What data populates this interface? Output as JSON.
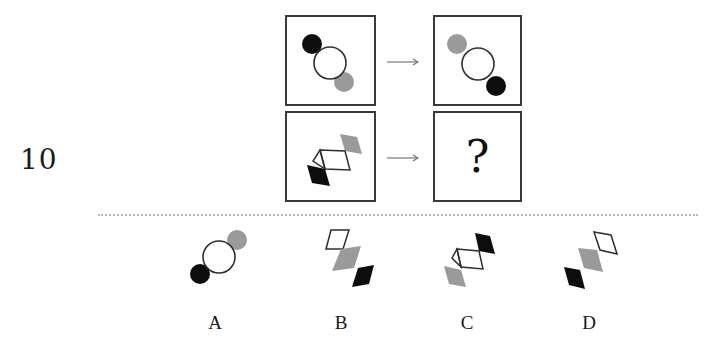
{
  "question": {
    "number": "10",
    "missing_symbol": "?",
    "arrow_symbol": "→",
    "rows": [
      {
        "left": "circle-group: black circle upper-left, white ring center, gray circle lower-right",
        "right": "circle-group: gray circle upper-left, white ring center, black circle lower-right"
      },
      {
        "left": "diamond-chain: black diamond lower-left, two white outlined diamonds center, gray diamond upper-right",
        "right": "?"
      }
    ]
  },
  "options": [
    {
      "label": "A",
      "description": "black circle lower-left, white ring center, gray circle upper-right"
    },
    {
      "label": "B",
      "description": "white diamond upper-left, gray diamond center, black diamond lower-right"
    },
    {
      "label": "C",
      "description": "gray diamond lower-left, two white diamonds center, black diamond upper-right"
    },
    {
      "label": "D",
      "description": "black diamond lower-left, gray diamond center, white diamond upper-right"
    }
  ],
  "colors": {
    "black": "#0d0d0d",
    "gray": "#9a9a9a",
    "outline": "#2e2e2e",
    "border": "#3a3a3a",
    "divider": "#b8b8b8"
  }
}
